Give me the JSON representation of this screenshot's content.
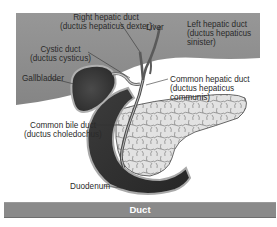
{
  "figure": {
    "caption": "Duct",
    "labels": {
      "right_hepatic_duct": "Right hepatic duct",
      "right_hepatic_duct_latin": "(ductus hepaticus dexter)",
      "liver": "Liver",
      "left_hepatic_duct": "Left hepatic duct",
      "left_hepatic_duct_latin_1": "(ductus hepaticus",
      "left_hepatic_duct_latin_2": "sinister)",
      "cystic_duct": "Cystic duct",
      "cystic_duct_latin": "(ductus cysticus)",
      "gallbladder": "Gallbladder",
      "common_hepatic_duct": "Common hepatic duct",
      "common_hepatic_duct_latin_1": "(ductus hepaticus",
      "common_hepatic_duct_latin_2": "communis)",
      "common_bile_duct": "Common bile duct",
      "common_bile_duct_latin": "(ductus choledochus)",
      "duodenum": "Duodenum"
    },
    "colors": {
      "liver": "#8e8e8e",
      "gallbladder": "#3a3a3a",
      "duodenum_dark": "#2f2f2f",
      "duodenum_rim": "#a9a9a9",
      "pancreas": "#dedede",
      "caption_bar": "#8a8a8a",
      "caption_text": "#ffffff"
    }
  }
}
